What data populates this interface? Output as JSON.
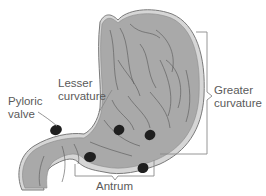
{
  "diagram": {
    "labels": {
      "lesser_curvature": {
        "line1": "Lesser",
        "line2": "curvature"
      },
      "pyloric_valve": {
        "line1": "Pyloric",
        "line2": "valve"
      },
      "greater_curvature": {
        "line1": "Greater",
        "line2": "curvature"
      },
      "antrum": {
        "text": "Antrum"
      }
    },
    "colors": {
      "stomach_fill": "#a9a9a9",
      "stomach_outline": "#7a7a7a",
      "rim_highlight": "#d4d4d4",
      "rugae_lines": "#555555",
      "dark_spots": "#1f1f1f",
      "leader_lines": "#8a8a8a",
      "label_text": "#5a5a5a"
    }
  }
}
